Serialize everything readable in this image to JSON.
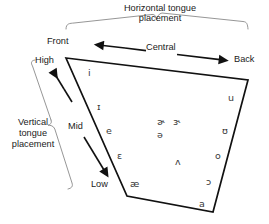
{
  "diagram": {
    "headers": {
      "horizontal_line1": "Horizontal tongue",
      "horizontal_line2": "placement",
      "vertical_line1": "Vertical",
      "vertical_line2": "tongue",
      "vertical_line3": "placement"
    },
    "horizontal_axis": {
      "left_label": "Front",
      "mid_label": "Central",
      "right_label": "Back"
    },
    "vertical_axis": {
      "top_label": "High",
      "mid_label": "Mid",
      "bottom_label": "Low"
    },
    "vowels": [
      {
        "symbol": "i",
        "name": "close-front-unrounded",
        "x": 88,
        "y": 68
      },
      {
        "symbol": "ɪ",
        "name": "near-close-front-unrounded",
        "x": 97,
        "y": 102
      },
      {
        "symbol": "e",
        "name": "close-mid-front-unrounded",
        "x": 106,
        "y": 126
      },
      {
        "symbol": "ɛ",
        "name": "open-mid-front-unrounded",
        "x": 117,
        "y": 151
      },
      {
        "symbol": "æ",
        "name": "near-open-front-unrounded",
        "x": 130,
        "y": 179
      },
      {
        "symbol": "ɚ",
        "name": "r-colored-schwa",
        "x": 157,
        "y": 117
      },
      {
        "symbol": "ɝ",
        "name": "r-colored-open-mid-central",
        "x": 173,
        "y": 117
      },
      {
        "symbol": "ə",
        "name": "schwa",
        "x": 157,
        "y": 130
      },
      {
        "symbol": "ʌ",
        "name": "open-mid-back-unrounded",
        "x": 175,
        "y": 157
      },
      {
        "symbol": "u",
        "name": "close-back-rounded",
        "x": 228,
        "y": 93
      },
      {
        "symbol": "ʊ",
        "name": "near-close-back-rounded",
        "x": 222,
        "y": 126
      },
      {
        "symbol": "o",
        "name": "close-mid-back-rounded",
        "x": 215,
        "y": 151
      },
      {
        "symbol": "ɔ",
        "name": "open-mid-back-rounded",
        "x": 206,
        "y": 177
      },
      {
        "symbol": "a",
        "name": "open-front-unrounded",
        "x": 199,
        "y": 199
      }
    ],
    "colors": {
      "quad_stroke": "#111111",
      "arrow_stroke": "#111111",
      "brace_stroke": "#8a8a8a",
      "text": "#1a1a1a",
      "vowel_text": "#3a3a3a",
      "background": "#ffffff"
    }
  }
}
